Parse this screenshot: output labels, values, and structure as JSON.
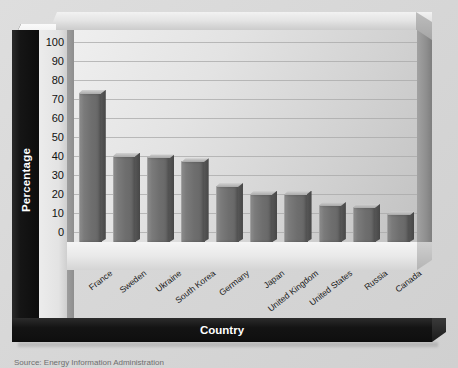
{
  "chart_data": {
    "type": "bar",
    "title": "",
    "xlabel": "Country",
    "ylabel": "Percentage",
    "ylim": [
      0,
      100
    ],
    "ytick_step": 10,
    "yticks": [
      "100",
      "90",
      "80",
      "70",
      "60",
      "50",
      "40",
      "30",
      "20",
      "10",
      "0"
    ],
    "grid": true,
    "legend": "none",
    "orientation": "vertical",
    "style_3d": true,
    "categories": [
      "France",
      "Sweden",
      "Ukraine",
      "South Korea",
      "Germany",
      "Japan",
      "United Kingdom",
      "United States",
      "Russia",
      "Canada"
    ],
    "values": [
      78,
      45,
      44,
      42,
      29,
      25,
      25,
      19,
      18,
      14
    ],
    "bars": [
      {
        "category": "France",
        "value": 78
      },
      {
        "category": "Sweden",
        "value": 45
      },
      {
        "category": "Ukraine",
        "value": 44
      },
      {
        "category": "South Korea",
        "value": 42
      },
      {
        "category": "Germany",
        "value": 29
      },
      {
        "category": "Japan",
        "value": 25
      },
      {
        "category": "United Kingdom",
        "value": 25
      },
      {
        "category": "United States",
        "value": 19
      },
      {
        "category": "Russia",
        "value": 18
      },
      {
        "category": "Canada",
        "value": 14
      }
    ]
  },
  "caption": {
    "source": "Source: Energy Information Administration"
  },
  "colors": {
    "bar_fill": "#6e6e6e",
    "bar_highlight": "#8b8b8b",
    "bar_shadow": "#4f4f4f",
    "axis_band": "#101010",
    "axis_band_text": "#ffffff",
    "plot_background": "#e3e3e3",
    "gridline": "#a8a8a8",
    "page_background": "#d9d9d9",
    "tick_text": "#111111"
  }
}
